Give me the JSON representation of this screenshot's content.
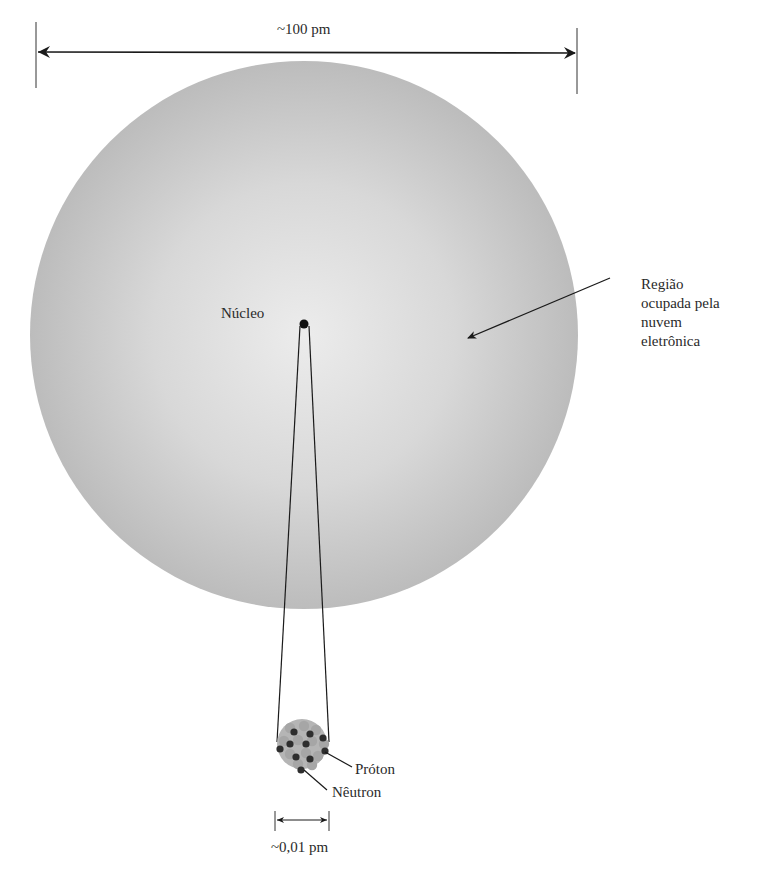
{
  "diagram": {
    "type": "atom-structure",
    "atom_scale_label": "~100 pm",
    "nucleus_scale_label": "~0,01 pm",
    "labels": {
      "nucleus": "Núcleo",
      "electron_cloud": "Região ocupada pela nuvem eletrônica",
      "electron_cloud_lines": [
        "Região",
        "ocupada pela",
        "nuvem",
        "eletrônica"
      ],
      "proton": "Próton",
      "neutron": "Nêutron"
    },
    "colors": {
      "cloud_center": "#ececec",
      "cloud_edge": "#bdbdbd",
      "ink": "#1a1a1a",
      "proton": "#a8a8a8",
      "neutron": "#333333"
    }
  }
}
